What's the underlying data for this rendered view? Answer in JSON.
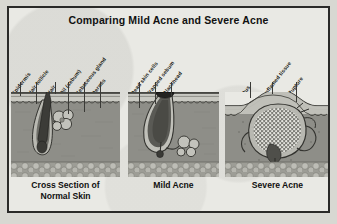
{
  "figure": {
    "title": "Comparing Mild Acne and Severe Acne",
    "border_color": "#2a2a28",
    "paper_color": "#e9e9e4"
  },
  "panels": [
    {
      "id": "normal",
      "caption_line1": "Cross Section of",
      "caption_line2": "Normal Skin",
      "labels": [
        "Epidermis",
        "Hair follicle",
        "Hair",
        "Oil (sebum)",
        "Sebaceous gland",
        "Dermis"
      ]
    },
    {
      "id": "mild",
      "caption_line1": "Mild Acne",
      "caption_line2": "",
      "labels": [
        "Dead skin cells",
        "Trapped sebum",
        "Blackhead"
      ]
    },
    {
      "id": "severe",
      "caption_line1": "Severe Acne",
      "caption_line2": "",
      "labels": [
        "Pus",
        "Inflamed tissue",
        "Rupture"
      ]
    }
  ],
  "colors": {
    "epidermis": "#c9c9c2",
    "dermis": "#8e8e88",
    "fat": "#a7a7a0",
    "follicle_dark": "#4a4a45",
    "outline": "#2f2f2b",
    "pus": "#cfcfc8"
  }
}
